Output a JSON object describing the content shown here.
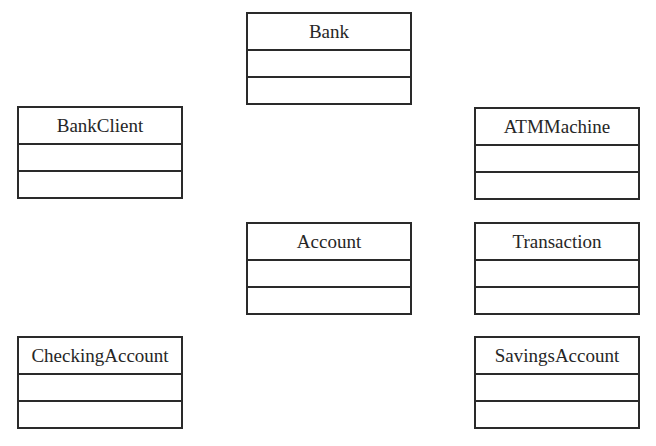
{
  "diagram": {
    "type": "uml-class-diagram",
    "classes": [
      {
        "id": "bank",
        "name": "Bank",
        "attributes": [],
        "operations": [],
        "x": 246,
        "y": 12
      },
      {
        "id": "bank-client",
        "name": "BankClient",
        "attributes": [],
        "operations": [],
        "x": 17,
        "y": 106
      },
      {
        "id": "atm-machine",
        "name": "ATMMachine",
        "attributes": [],
        "operations": [],
        "x": 474,
        "y": 107
      },
      {
        "id": "account",
        "name": "Account",
        "attributes": [],
        "operations": [],
        "x": 246,
        "y": 222
      },
      {
        "id": "transaction",
        "name": "Transaction",
        "attributes": [],
        "operations": [],
        "x": 474,
        "y": 222
      },
      {
        "id": "checking-account",
        "name": "CheckingAccount",
        "attributes": [],
        "operations": [],
        "x": 17,
        "y": 336
      },
      {
        "id": "savings-account",
        "name": "SavingsAccount",
        "attributes": [],
        "operations": [],
        "x": 474,
        "y": 336
      }
    ],
    "colors": {
      "line": "#2a2a2a",
      "text": "#262626",
      "background": "#ffffff"
    }
  }
}
